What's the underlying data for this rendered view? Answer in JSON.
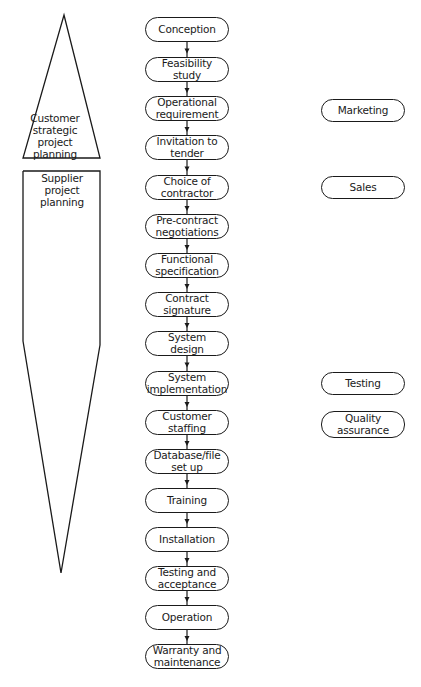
{
  "left_panel": {
    "customer_label": "Customer strategic project planning",
    "supplier_label": "Supplier project planning"
  },
  "stages": [
    {
      "label": "Conception",
      "top": 17
    },
    {
      "label": "Feasibility study",
      "top": 57
    },
    {
      "label": "Operational requirement",
      "top": 96
    },
    {
      "label": "Invitation to tender",
      "top": 135
    },
    {
      "label": "Choice of contractor",
      "top": 175
    },
    {
      "label": "Pre-contract negotiations",
      "top": 214
    },
    {
      "label": "Functional specification",
      "top": 253
    },
    {
      "label": "Contract signature",
      "top": 292
    },
    {
      "label": "System design",
      "top": 331
    },
    {
      "label": "System implementation",
      "top": 371
    },
    {
      "label": "Customer staffing",
      "top": 410
    },
    {
      "label": "Database/file set up",
      "top": 449
    },
    {
      "label": "Training",
      "top": 488
    },
    {
      "label": "Installation",
      "top": 527
    },
    {
      "label": "Testing and acceptance",
      "top": 566
    },
    {
      "label": "Operation",
      "top": 605
    },
    {
      "label": "Warranty and maintenance",
      "top": 644
    }
  ],
  "side_functions": [
    {
      "label": "Marketing",
      "top": 99,
      "height": 23
    },
    {
      "label": "Sales",
      "top": 176,
      "height": 23
    },
    {
      "label": "Testing",
      "top": 372,
      "height": 23
    },
    {
      "label": "Quality assurance",
      "top": 411,
      "height": 27
    }
  ],
  "colors": {
    "stroke": "#1a1a1a",
    "background": "#ffffff"
  }
}
